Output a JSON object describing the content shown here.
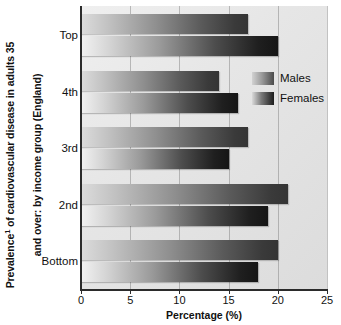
{
  "chart_data": {
    "type": "bar",
    "orientation": "horizontal",
    "title_line1": "Prevalence",
    "title_sup": "1",
    "title_line1_rest": " of cardiovascular disease in adults 35",
    "title_line2": "and over: by income group (England)",
    "xlabel": "Percentage (%)",
    "ylabel": "",
    "categories": [
      "Top",
      "4th",
      "3rd",
      "2nd",
      "Bottom"
    ],
    "series": [
      {
        "name": "Males",
        "values": [
          17,
          14,
          17,
          21,
          20
        ],
        "color": "#5a5a5a"
      },
      {
        "name": "Females",
        "values": [
          20,
          16,
          15,
          19,
          18
        ],
        "color": "#1f1f1f"
      }
    ],
    "xlim": [
      0,
      25
    ],
    "xticks": [
      0,
      5,
      10,
      15,
      20,
      25
    ],
    "xtick_labels": [
      "0",
      "5",
      "10",
      "15",
      "20",
      "25"
    ],
    "grid": true,
    "grid_axis": "x",
    "legend_position": "inside-upper-right"
  },
  "legend": {
    "items": [
      {
        "label": "Males"
      },
      {
        "label": "Females"
      }
    ]
  },
  "axis": {
    "x_title": "Percentage (%)"
  }
}
